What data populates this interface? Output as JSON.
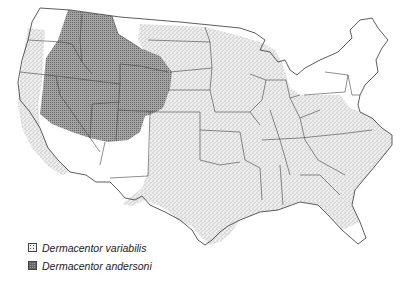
{
  "map": {
    "subject": "Distribution of Dermacentor ticks in the contiguous United States",
    "colors": {
      "background": "#ffffff",
      "border": "#333333",
      "variabilis_fill": "#ececec",
      "variabilis_dots": "#555555",
      "andersoni_fill": "#9a9a9a",
      "andersoni_hatch": "#6a6a6a"
    }
  },
  "legend": {
    "items": [
      {
        "label": "Dermacentor variabilis",
        "pattern": "stipple"
      },
      {
        "label": "Dermacentor andersoni",
        "pattern": "crosshatch"
      }
    ]
  }
}
